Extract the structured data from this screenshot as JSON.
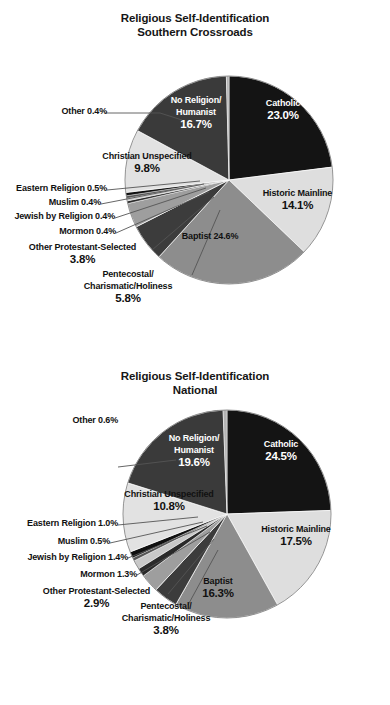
{
  "page": {
    "background": "#ffffff",
    "text_color": "#111111"
  },
  "palette": {
    "catholic": "#141414",
    "historic_mainline": "#dedede",
    "baptist": "#8d8d8d",
    "pentecostal": "#3c3c3c",
    "other_protestant": "#9e9e9e",
    "mormon": "#2a2a2a",
    "jewish": "#c8c8c8",
    "muslim": "#555555",
    "eastern_religion": "#101010",
    "christian_unspecified": "#e2e2e2",
    "no_religion": "#3a3a3a",
    "other": "#b4b4b4",
    "outline": "#6a6a6a"
  },
  "charts": [
    {
      "id": "southern-crossroads",
      "title_line1": "Religious Self-Identification",
      "title_line2": "Southern Crossroads",
      "labels": {
        "catholic": "Catholic",
        "catholic_pct": "23.0%",
        "historic_mainline": "Historic Mainline",
        "historic_mainline_pct": "14.1%",
        "baptist": "Baptist 24.6%",
        "pentecostal_l1": "Pentecostal/",
        "pentecostal_l2": "Charismatic/Holiness",
        "pentecostal_pct": "5.8%",
        "other_protestant": "Other Protestant-Selected",
        "other_protestant_pct": "3.8%",
        "mormon": "Mormon 0.4%",
        "jewish": "Jewish by Religion 0.4%",
        "muslim": "Muslim 0.4%",
        "eastern": "Eastern Religion 0.5%",
        "christian_unspecified": "Christian Unspecified",
        "christian_unspecified_pct": "9.8%",
        "other": "Other 0.4%",
        "no_religion_l1": "No Religion/",
        "no_religion_l2": "Humanist",
        "no_religion_pct": "16.7%"
      }
    },
    {
      "id": "national",
      "title_line1": "Religious Self-Identification",
      "title_line2": "National",
      "labels": {
        "catholic": "Catholic",
        "catholic_pct": "24.5%",
        "historic_mainline": "Historic Mainline",
        "historic_mainline_pct": "17.5%",
        "baptist": "Baptist",
        "baptist_pct": "16.3%",
        "pentecostal_l1": "Pentecostal/",
        "pentecostal_l2": "Charismatic/Holiness",
        "pentecostal_pct": "3.8%",
        "other_protestant": "Other Protestant-Selected",
        "other_protestant_pct": "2.9%",
        "mormon": "Mormon 1.3%",
        "jewish": "Jewish by Religion 1.4%",
        "muslim": "Muslim 0.5%",
        "eastern": "Eastern Religion 1.0%",
        "christian_unspecified": "Christian Unspecified",
        "christian_unspecified_pct": "10.8%",
        "other": "Other 0.6%",
        "no_religion_l1": "No Religion/",
        "no_religion_l2": "Humanist",
        "no_religion_pct": "19.6%"
      }
    }
  ],
  "chart_data": [
    {
      "type": "pie",
      "title": "Religious Self-Identification Southern Crossroads",
      "subtitle": "Southern Crossroads",
      "unit": "percent",
      "start_angle_deg": -90,
      "direction": "clockwise",
      "legend": "none",
      "labels_position": "inside-and-outside-with-leaders",
      "categories": [
        "Catholic",
        "Historic Mainline",
        "Baptist",
        "Pentecostal/Charismatic/Holiness",
        "Other Protestant-Selected",
        "Mormon",
        "Jewish by Religion",
        "Muslim",
        "Eastern Religion",
        "Christian Unspecified",
        "No Religion/Humanist",
        "Other"
      ],
      "values": [
        23.0,
        14.1,
        24.6,
        5.8,
        3.8,
        0.4,
        0.4,
        0.4,
        0.5,
        9.8,
        16.7,
        0.4
      ],
      "value_labels": [
        "23.0%",
        "14.1%",
        "24.6%",
        "5.8%",
        "3.8%",
        "0.4%",
        "0.4%",
        "0.4%",
        "0.5%",
        "9.8%",
        "16.7%",
        "0.4%"
      ],
      "colors": [
        "#141414",
        "#dedede",
        "#8d8d8d",
        "#3c3c3c",
        "#9e9e9e",
        "#2a2a2a",
        "#c8c8c8",
        "#555555",
        "#101010",
        "#e2e2e2",
        "#3a3a3a",
        "#b4b4b4"
      ],
      "total": 99.9
    },
    {
      "type": "pie",
      "title": "Religious Self-Identification National",
      "subtitle": "National",
      "unit": "percent",
      "start_angle_deg": -90,
      "direction": "clockwise",
      "legend": "none",
      "labels_position": "inside-and-outside-with-leaders",
      "categories": [
        "Catholic",
        "Historic Mainline",
        "Baptist",
        "Pentecostal/Charismatic/Holiness",
        "Other Protestant-Selected",
        "Mormon",
        "Jewish by Religion",
        "Muslim",
        "Eastern Religion",
        "Christian Unspecified",
        "No Religion/Humanist",
        "Other"
      ],
      "values": [
        24.5,
        17.5,
        16.3,
        3.8,
        2.9,
        1.3,
        1.4,
        0.5,
        1.0,
        10.8,
        19.6,
        0.6
      ],
      "value_labels": [
        "24.5%",
        "17.5%",
        "16.3%",
        "3.8%",
        "2.9%",
        "1.3%",
        "1.4%",
        "0.5%",
        "1.0%",
        "10.8%",
        "19.6%",
        "0.6%"
      ],
      "colors": [
        "#141414",
        "#dedede",
        "#8d8d8d",
        "#3c3c3c",
        "#9e9e9e",
        "#2a2a2a",
        "#c8c8c8",
        "#555555",
        "#101010",
        "#e2e2e2",
        "#3a3a3a",
        "#b4b4b4"
      ],
      "total": 100.2
    }
  ]
}
